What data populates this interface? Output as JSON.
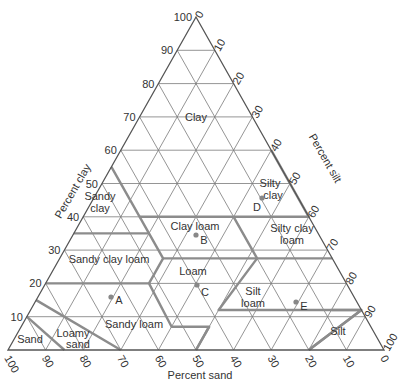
{
  "axes": {
    "clay": {
      "label": "Percent clay",
      "ticks": [
        "10",
        "20",
        "30",
        "40",
        "50",
        "60",
        "70",
        "80",
        "90",
        "100"
      ]
    },
    "silt": {
      "label": "Percent silt",
      "ticks": [
        "0",
        "10",
        "20",
        "30",
        "40",
        "50",
        "60",
        "70",
        "80",
        "90",
        "100"
      ]
    },
    "sand": {
      "label": "Percent sand",
      "ticks": [
        "100",
        "90",
        "80",
        "70",
        "60",
        "50",
        "40",
        "30",
        "20",
        "10",
        "0"
      ]
    }
  },
  "classes": [
    {
      "id": "clay",
      "label": [
        "Clay"
      ]
    },
    {
      "id": "sandy-clay",
      "label": [
        "Sandy",
        "clay"
      ]
    },
    {
      "id": "silty-clay",
      "label": [
        "Silty",
        "clay"
      ]
    },
    {
      "id": "clay-loam",
      "label": [
        "Clay loam"
      ]
    },
    {
      "id": "silty-clay-loam",
      "label": [
        "Silty clay",
        "loam"
      ]
    },
    {
      "id": "sandy-clay-loam",
      "label": [
        "Sandy clay loam"
      ]
    },
    {
      "id": "loam",
      "label": [
        "Loam"
      ]
    },
    {
      "id": "silt-loam",
      "label": [
        "Silt",
        "loam"
      ]
    },
    {
      "id": "sandy-loam",
      "label": [
        "Sandy loam"
      ]
    },
    {
      "id": "loamy-sand",
      "label": [
        "Loamy",
        "sand"
      ]
    },
    {
      "id": "sand",
      "label": [
        "Sand"
      ]
    },
    {
      "id": "silt",
      "label": [
        "Silt"
      ]
    }
  ],
  "points": [
    {
      "id": "A",
      "clay": 16,
      "silt": 10
    },
    {
      "id": "B",
      "clay": 34,
      "silt": 35
    },
    {
      "id": "C",
      "clay": 20,
      "silt": 40
    },
    {
      "id": "D",
      "clay": 45,
      "silt": 48
    },
    {
      "id": "E",
      "clay": 15,
      "silt": 68
    }
  ],
  "colors": {
    "grid": "#7a7a7a",
    "boundary": "#8c8c8c",
    "text": "#333333",
    "point": "#888888"
  }
}
